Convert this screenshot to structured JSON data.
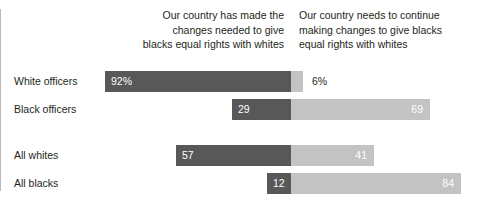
{
  "chart_data": {
    "type": "bar",
    "subtype": "diverging-stacked-bar",
    "title": "",
    "subtitle": "",
    "xlabel": "",
    "ylabel": "",
    "xlim": [
      0,
      100
    ],
    "grid": false,
    "legend_position": "top-as-column-headers",
    "categories": [
      "White officers",
      "Black officers",
      "All whites",
      "All blacks"
    ],
    "series": [
      {
        "name": "Our country has made the changes needed to give blacks equal rights with whites",
        "direction": "left",
        "color": "#585858",
        "values": [
          92,
          29,
          57,
          12
        ],
        "labels": [
          "92%",
          "29",
          "57",
          "12"
        ]
      },
      {
        "name": "Our country needs to continue making changes to give blacks equal rights with whites",
        "direction": "right",
        "color": "#c3c3c3",
        "values": [
          6,
          69,
          41,
          84
        ],
        "labels": [
          "6%",
          "69",
          "41",
          "84"
        ]
      }
    ]
  },
  "headers": {
    "left": "Our country has made the\nchanges needed to give\nblacks equal rights with whites",
    "right": "Our country needs to continue\nmaking changes to give blacks\nequal rights with whites"
  },
  "rows": [
    {
      "label": "White officers",
      "left_value": 92,
      "left_label": "92%",
      "right_value": 6,
      "right_label": "6%",
      "right_label_outside": true
    },
    {
      "label": "Black officers",
      "left_value": 29,
      "left_label": "29",
      "right_value": 69,
      "right_label": "69",
      "right_label_outside": false
    },
    {
      "label": "All whites",
      "left_value": 57,
      "left_label": "57",
      "right_value": 41,
      "right_label": "41",
      "right_label_outside": false
    },
    {
      "label": "All blacks",
      "left_value": 12,
      "left_label": "12",
      "right_value": 84,
      "right_label": "84",
      "right_label_outside": false
    }
  ],
  "colors": {
    "left_bar": "#585858",
    "right_bar": "#c3c3c3",
    "divider": "#b9b9b9",
    "text": "#231f20",
    "bar_label_light": "#ffffff",
    "background": "#ffffff"
  },
  "layout": {
    "center_x": 291,
    "px_per_unit": 2.02,
    "row_height": 21,
    "row_tops": [
      71,
      99,
      145,
      173
    ]
  }
}
